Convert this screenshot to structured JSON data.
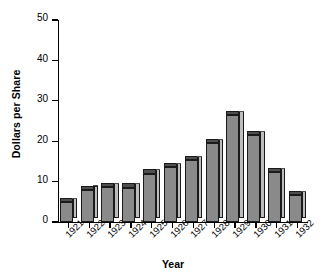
{
  "chart_data": {
    "type": "bar",
    "title": "",
    "xlabel": "Year",
    "ylabel": "Dollars per Share",
    "categories": [
      "1921",
      "1922",
      "1923",
      "1924",
      "1925",
      "1926",
      "1927",
      "1928",
      "1929",
      "1930",
      "1931",
      "1932"
    ],
    "values": [
      5.0,
      8.0,
      8.7,
      8.5,
      12.0,
      13.5,
      15.3,
      19.5,
      26.5,
      21.5,
      12.3,
      6.7
    ],
    "ylim": [
      0,
      50
    ],
    "yticks": [
      0,
      10,
      20,
      30,
      40,
      50
    ],
    "ytick_labels": [
      "0",
      "10",
      "20",
      "30",
      "40",
      "50"
    ],
    "grid": false,
    "legend": null,
    "bar_style": "3d-extruded",
    "colors": {
      "bar_front": "#8a8a8a",
      "bar_side": "#bdbdbd",
      "bar_top": "#4f4f4f",
      "bar_outline": "#1a1a1a",
      "axis": "#000000",
      "background": "#ffffff",
      "text": "#000000"
    }
  }
}
